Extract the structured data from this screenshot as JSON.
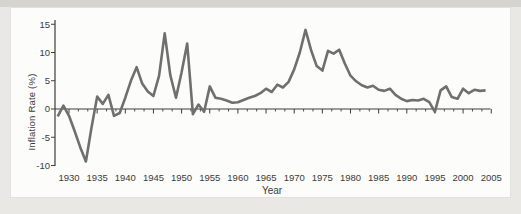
{
  "figure": {
    "xlabel": "Year",
    "ylabel": "Inflation Rate (%)"
  },
  "colors": {
    "line": "#6f6f6f",
    "axis": "#3c3c3c",
    "text": "#3b3b3b",
    "panel_bg": "#fcfcfa",
    "page_bg": "#e9e8e4",
    "top_band": "#d5d4d0"
  },
  "chart_data": {
    "type": "line",
    "title": "",
    "xlabel": "Year",
    "ylabel": "Inflation Rate (%)",
    "xlim": [
      1928,
      2005
    ],
    "ylim": [
      -10,
      15
    ],
    "grid": false,
    "legend": "none",
    "x_tick_labels": [
      "1930",
      "1935",
      "1940",
      "1945",
      "1950",
      "1955",
      "1960",
      "1965",
      "1970",
      "1975",
      "1980",
      "1985",
      "1990",
      "1995",
      "2000",
      "2005"
    ],
    "x_tick_values": [
      1930,
      1935,
      1940,
      1945,
      1950,
      1955,
      1960,
      1965,
      1970,
      1975,
      1980,
      1985,
      1990,
      1995,
      2000,
      2005
    ],
    "y_tick_labels": [
      "15",
      "10",
      "5",
      "0",
      "-5",
      "-10"
    ],
    "y_tick_values": [
      15,
      10,
      5,
      0,
      -5,
      -10
    ],
    "series": [
      {
        "name": "inflation-rate",
        "x": [
          1928,
          1929,
          1930,
          1931,
          1932,
          1933,
          1934,
          1935,
          1936,
          1937,
          1938,
          1939,
          1940,
          1941,
          1942,
          1943,
          1944,
          1945,
          1946,
          1947,
          1948,
          1949,
          1950,
          1951,
          1952,
          1953,
          1954,
          1955,
          1956,
          1957,
          1958,
          1959,
          1960,
          1961,
          1962,
          1963,
          1964,
          1965,
          1966,
          1967,
          1968,
          1969,
          1970,
          1971,
          1972,
          1973,
          1974,
          1975,
          1976,
          1977,
          1978,
          1979,
          1980,
          1981,
          1982,
          1983,
          1984,
          1985,
          1986,
          1987,
          1988,
          1989,
          1990,
          1991,
          1992,
          1993,
          1994,
          1995,
          1996,
          1997,
          1998,
          1999,
          2000,
          2001,
          2002,
          2003,
          2004
        ],
        "values": [
          -1.3,
          0.6,
          -1.2,
          -3.9,
          -6.8,
          -9.3,
          -3.3,
          2.2,
          0.9,
          2.5,
          -1.2,
          -0.7,
          2.0,
          5.0,
          7.4,
          4.5,
          3.1,
          2.3,
          5.9,
          13.4,
          6.0,
          2.0,
          6.5,
          11.6,
          -0.9,
          0.8,
          -0.5,
          4.0,
          2.0,
          1.8,
          1.5,
          1.1,
          1.2,
          1.6,
          2.0,
          2.3,
          2.8,
          3.6,
          3.0,
          4.3,
          3.8,
          4.8,
          7.0,
          10.0,
          14.0,
          10.4,
          7.6,
          6.8,
          10.3,
          9.8,
          10.5,
          8.0,
          5.9,
          4.9,
          4.2,
          3.8,
          4.1,
          3.4,
          3.2,
          3.6,
          2.5,
          1.8,
          1.4,
          1.6,
          1.5,
          1.8,
          1.2,
          -0.5,
          3.3,
          4.0,
          2.1,
          1.8,
          3.6,
          2.8,
          3.4,
          3.2,
          3.3
        ]
      }
    ]
  }
}
